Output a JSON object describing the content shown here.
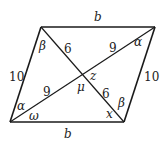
{
  "diagram": {
    "type": "parallelogram-with-diagonals",
    "colors": {
      "stroke": "#1a1a1a",
      "text": "#222222",
      "background": "#ffffff"
    },
    "vertices": {
      "top_left": [
        41,
        27
      ],
      "top_right": [
        155,
        27
      ],
      "bottom_right": [
        124,
        122
      ],
      "bottom_left": [
        10,
        122
      ],
      "center": [
        82,
        74
      ]
    },
    "sides": {
      "top": "b",
      "bottom": "b",
      "left": "10",
      "right": "10"
    },
    "diagonal_segments": {
      "top_left_to_center": "6",
      "center_to_bottom_right": "6",
      "top_right_to_center": "9",
      "bottom_left_to_center": "9"
    },
    "angles": {
      "top_left": "β",
      "top_right": "α",
      "bottom_left_upper": "α",
      "bottom_left_lower": "ω",
      "bottom_right_upper": "β",
      "bottom_right_lower": "x",
      "center_right": "z",
      "center_bottom": "μ"
    }
  }
}
